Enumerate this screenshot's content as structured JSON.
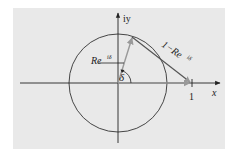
{
  "diagram": {
    "colors": {
      "background": "#e9e9e9",
      "axis": "#222222",
      "circle": "#333333",
      "vector": "#999999"
    },
    "labels": {
      "y_axis": "iy",
      "x_axis": "x",
      "one": "1",
      "vector_r": "Re",
      "vector_r_exp": "iδ",
      "vector_diff": "1−Re",
      "vector_diff_exp": "iδ",
      "angle": "δ"
    },
    "geometry": {
      "origin": [
        118,
        83
      ],
      "radius": 49,
      "point_R": [
        132,
        37
      ],
      "point_one": [
        192,
        83
      ]
    }
  }
}
